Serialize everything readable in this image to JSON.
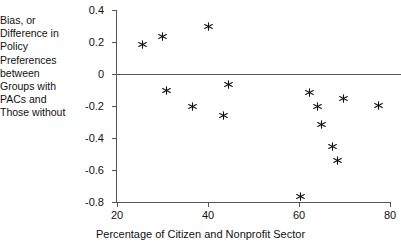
{
  "chart_data": {
    "type": "scatter",
    "title": "",
    "xlabel": "Percentage of Citizen and Nonprofit Sector",
    "ylabel": "Bias, or Difference in Policy Preferences between Groups with PACs and Those without",
    "xlim": [
      20,
      80
    ],
    "ylim": [
      -0.8,
      0.4
    ],
    "xticks": [
      20,
      40,
      60,
      80
    ],
    "xtick_labels": [
      "20",
      "40",
      "60",
      "80"
    ],
    "yticks": [
      0.4,
      0.2,
      0,
      -0.2,
      -0.4,
      -0.6,
      -0.8
    ],
    "ytick_labels": [
      "0.4",
      "0.2",
      "0",
      "-0.2",
      "-0.4",
      "-0.6",
      "-0.8"
    ],
    "grid": false,
    "legend": null,
    "zero_reference_line": 0,
    "marker": "asterisk",
    "marker_color": "#111111",
    "points": [
      {
        "x": 25.7,
        "y": 0.1875
      },
      {
        "x": 30.1,
        "y": 0.2313
      },
      {
        "x": 40.2,
        "y": 0.2938
      },
      {
        "x": 30.8,
        "y": -0.1
      },
      {
        "x": 36.7,
        "y": -0.2
      },
      {
        "x": 44.5,
        "y": -0.0625
      },
      {
        "x": 43.4,
        "y": -0.26
      },
      {
        "x": 62.4,
        "y": -0.1125
      },
      {
        "x": 64.0,
        "y": -0.2
      },
      {
        "x": 69.7,
        "y": -0.15
      },
      {
        "x": 77.4,
        "y": -0.1938
      },
      {
        "x": 64.9,
        "y": -0.3125
      },
      {
        "x": 67.3,
        "y": -0.45
      },
      {
        "x": 68.4,
        "y": -0.5375
      },
      {
        "x": 60.4,
        "y": -0.7625
      }
    ]
  }
}
